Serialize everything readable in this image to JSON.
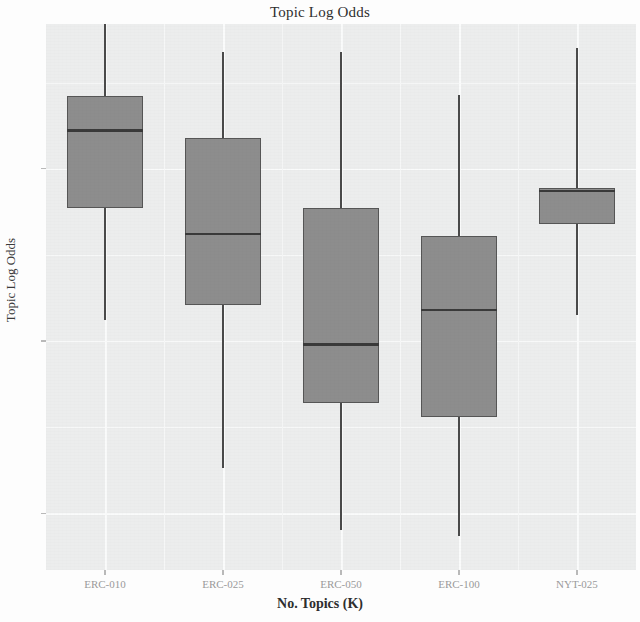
{
  "chart_data": {
    "type": "box",
    "title": "Topic Log Odds",
    "xlabel": "No. Topics (K)",
    "ylabel": "Topic Log Odds",
    "categories": [
      "ERC-010",
      "ERC-025",
      "ERC-050",
      "ERC-100",
      "NYT-025"
    ],
    "ytick_labels": [
      "-1",
      "-2",
      "-3"
    ],
    "ytick_values": [
      -1,
      -2,
      -3
    ],
    "ylim": [
      -3.33,
      -0.16
    ],
    "grid": true,
    "legend": "none",
    "boxes": [
      {
        "category": "ERC-010",
        "whisker_high": -0.16,
        "q3": -0.58,
        "median": -0.78,
        "q1": -1.23,
        "whisker_low": -1.88
      },
      {
        "category": "ERC-025",
        "whisker_high": -0.32,
        "q3": -0.82,
        "median": -1.38,
        "q1": -1.79,
        "whisker_low": -2.74
      },
      {
        "category": "ERC-050",
        "whisker_high": -0.32,
        "q3": -1.23,
        "median": -2.02,
        "q1": -2.36,
        "whisker_low": -3.1
      },
      {
        "category": "ERC-100",
        "whisker_high": -0.57,
        "q3": -1.39,
        "median": -1.82,
        "q1": -2.44,
        "whisker_low": -3.13
      },
      {
        "category": "NYT-025",
        "whisker_high": -0.3,
        "q3": -1.11,
        "median": -1.13,
        "q1": -1.32,
        "whisker_low": -1.85
      }
    ],
    "colors": {
      "box_fill": "#8d8d8d",
      "box_border": "#565656",
      "median": "#3a3a3a",
      "whisker": "#4a4a4a",
      "panel_background": "#eceded",
      "grid": "#fafbfb",
      "figure_background": "#fdfdfd",
      "text": "#2e2e2e",
      "tick_text": "#9a9a9a"
    }
  }
}
